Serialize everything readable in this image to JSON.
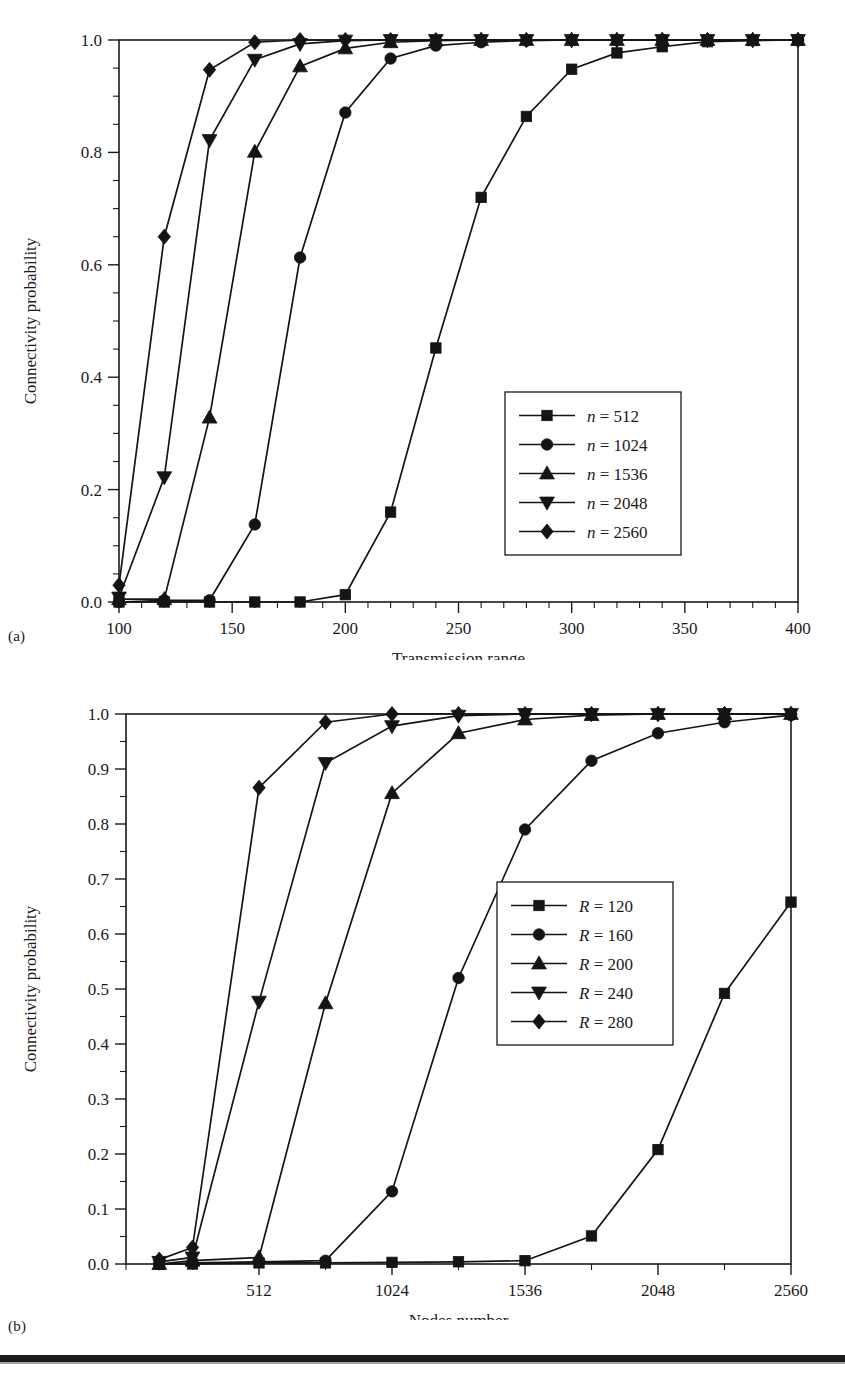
{
  "figure": {
    "panel_a_tag": "(a)",
    "panel_b_tag": "(b)"
  },
  "chart_data": [
    {
      "id": "chart-a",
      "type": "line",
      "title": "",
      "xlabel": "Transmission range",
      "ylabel": "Connectivity probability",
      "xlim": [
        100,
        400
      ],
      "ylim": [
        0.0,
        1.0
      ],
      "xticks": [
        100,
        150,
        200,
        250,
        300,
        350,
        400
      ],
      "xtick_labels": [
        "100",
        "150",
        "200",
        "250",
        "300",
        "350",
        "400"
      ],
      "xminor_step": 10,
      "yticks": [
        0.0,
        0.2,
        0.4,
        0.6,
        0.8,
        1.0
      ],
      "ytick_labels": [
        "0.0",
        "0.2",
        "0.4",
        "0.6",
        "0.8",
        "1.0"
      ],
      "yminor_step": 0.05,
      "grid": false,
      "legend_position": "lower-right",
      "x": [
        100,
        120,
        140,
        160,
        180,
        200,
        220,
        240,
        260,
        280,
        300,
        320,
        340,
        360,
        380,
        400
      ],
      "series": [
        {
          "name": "n = 512",
          "marker": "square",
          "values": [
            0.0,
            0.0,
            0.0,
            0.0,
            0.0,
            0.013,
            0.16,
            0.452,
            0.72,
            0.864,
            0.948,
            0.977,
            0.988,
            0.997,
            0.999,
            1.0
          ]
        },
        {
          "name": "n = 1024",
          "marker": "circle",
          "values": [
            0.0,
            0.003,
            0.003,
            0.138,
            0.613,
            0.871,
            0.967,
            0.99,
            0.996,
            0.999,
            1.0,
            1.0,
            1.0,
            1.0,
            1.0,
            1.0
          ]
        },
        {
          "name": "n = 1536",
          "marker": "triangle-up",
          "values": [
            0.005,
            0.005,
            0.328,
            0.801,
            0.953,
            0.985,
            0.996,
            0.999,
            1.0,
            1.0,
            1.0,
            1.0,
            1.0,
            1.0,
            1.0,
            1.0
          ]
        },
        {
          "name": "n = 2048",
          "marker": "triangle-down",
          "values": [
            0.008,
            0.222,
            0.822,
            0.965,
            0.993,
            0.999,
            1.0,
            1.0,
            1.0,
            1.0,
            1.0,
            1.0,
            1.0,
            1.0,
            1.0,
            1.0
          ]
        },
        {
          "name": "n = 2560",
          "marker": "diamond",
          "values": [
            0.03,
            0.65,
            0.947,
            0.996,
            1.0,
            1.0,
            1.0,
            1.0,
            1.0,
            1.0,
            1.0,
            1.0,
            1.0,
            1.0,
            1.0,
            1.0
          ]
        }
      ]
    },
    {
      "id": "chart-b",
      "type": "line",
      "title": "",
      "xlabel": "Nodes number",
      "ylabel": "Connectivity probability",
      "xlim": [
        0,
        2560
      ],
      "ylim": [
        0.0,
        1.0
      ],
      "xticks": [
        512,
        1024,
        1536,
        2048,
        2560
      ],
      "xtick_labels": [
        "512",
        "1024",
        "1536",
        "2048",
        "2560"
      ],
      "xminor_step": 256,
      "yticks": [
        0.0,
        0.1,
        0.2,
        0.3,
        0.4,
        0.5,
        0.6,
        0.7,
        0.8,
        0.9,
        1.0
      ],
      "ytick_labels": [
        "0.0",
        "0.1",
        "0.2",
        "0.3",
        "0.4",
        "0.5",
        "0.6",
        "0.7",
        "0.8",
        "0.9",
        "1.0"
      ],
      "yminor_step": 0.05,
      "grid": false,
      "legend_position": "center-right",
      "x": [
        128,
        256,
        512,
        768,
        1024,
        1280,
        1536,
        1792,
        2048,
        2304,
        2560
      ],
      "series": [
        {
          "name": "R = 120",
          "marker": "square",
          "values": [
            0.0,
            0.0,
            0.002,
            0.002,
            0.003,
            0.004,
            0.006,
            0.051,
            0.208,
            0.492,
            0.658
          ]
        },
        {
          "name": "R = 160",
          "marker": "circle",
          "values": [
            0.0,
            0.002,
            0.004,
            0.006,
            0.132,
            0.52,
            0.79,
            0.915,
            0.965,
            0.985,
            0.998
          ]
        },
        {
          "name": "R = 200",
          "marker": "triangle-up",
          "values": [
            0.0,
            0.006,
            0.012,
            0.474,
            0.856,
            0.965,
            0.99,
            0.998,
            1.0,
            1.0,
            1.0
          ]
        },
        {
          "name": "R = 240",
          "marker": "triangle-down",
          "values": [
            0.004,
            0.012,
            0.477,
            0.911,
            0.978,
            0.997,
            1.0,
            1.0,
            1.0,
            1.0,
            1.0
          ]
        },
        {
          "name": "R = 280",
          "marker": "diamond",
          "values": [
            0.008,
            0.03,
            0.866,
            0.985,
            1.0,
            1.0,
            1.0,
            1.0,
            1.0,
            1.0,
            1.0
          ]
        }
      ]
    }
  ]
}
